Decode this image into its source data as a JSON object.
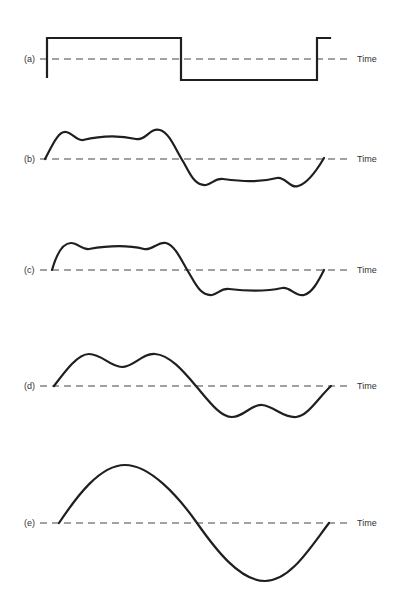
{
  "figure": {
    "axis_label": "Time",
    "panels": [
      {
        "id": "a",
        "label": "(a)",
        "axis_label": "Time",
        "description": "Square wave"
      },
      {
        "id": "b",
        "label": "(b)",
        "axis_label": "Time",
        "description": "Approximation with many harmonics"
      },
      {
        "id": "c",
        "label": "(c)",
        "axis_label": "Time",
        "description": "Approximation with fewer harmonics"
      },
      {
        "id": "d",
        "label": "(d)",
        "axis_label": "Time",
        "description": "Fundamental plus third harmonic"
      },
      {
        "id": "e",
        "label": "(e)",
        "axis_label": "Time",
        "description": "Fundamental sine wave"
      }
    ]
  },
  "colors": {
    "background": "#ffffff",
    "wave": "#1f1f1f",
    "baseline": "#444444",
    "text": "#333333"
  }
}
